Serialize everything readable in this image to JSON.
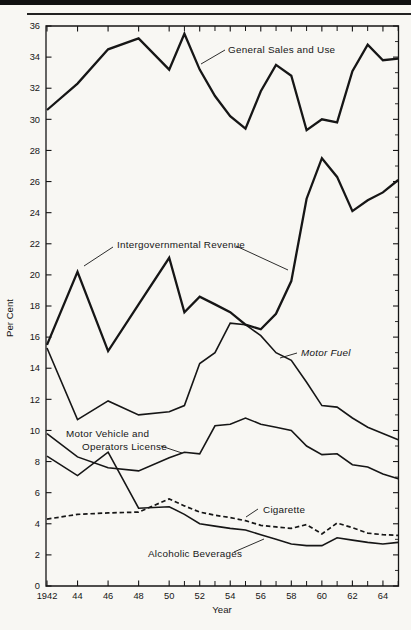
{
  "chart_data": {
    "type": "line",
    "title": "",
    "xlabel": "Year",
    "ylabel": "Per Cent",
    "xlim": [
      1942,
      1965
    ],
    "ylim": [
      0,
      36
    ],
    "grid": false,
    "legend": "inline-annotations",
    "line_color": "#161616",
    "x": [
      1942,
      1944,
      1946,
      1948,
      1950,
      1951,
      1952,
      1953,
      1954,
      1955,
      1956,
      1957,
      1958,
      1959,
      1960,
      1961,
      1962,
      1963,
      1964,
      1965
    ],
    "series": [
      {
        "name": "General Sales and Use",
        "key": "general-sales-and-use",
        "dash": false,
        "width": 2.3,
        "values": [
          30.6,
          32.3,
          34.5,
          35.2,
          33.2,
          35.5,
          33.2,
          31.5,
          30.2,
          29.4,
          31.8,
          33.5,
          32.8,
          29.3,
          30.0,
          29.8,
          33.1,
          34.8,
          33.8,
          33.9
        ]
      },
      {
        "name": "Intergovernmental Revenue",
        "key": "intergovernmental-revenue",
        "dash": false,
        "width": 2.3,
        "values": [
          15.5,
          20.2,
          15.1,
          18.1,
          21.1,
          17.6,
          18.6,
          18.1,
          17.6,
          16.8,
          16.5,
          17.5,
          19.6,
          24.9,
          27.5,
          26.3,
          24.1,
          24.8,
          25.3,
          26.1
        ]
      },
      {
        "name": "Motor Fuel",
        "key": "motor-fuel",
        "dash": false,
        "width": 1.6,
        "values": [
          15.3,
          10.7,
          11.9,
          11.0,
          11.2,
          11.6,
          14.3,
          15.0,
          16.9,
          16.8,
          16.1,
          15.0,
          14.5,
          13.1,
          11.6,
          11.5,
          10.8,
          10.2,
          9.8,
          9.4
        ]
      },
      {
        "name": "Motor Vehicle and Operators License",
        "key": "motor-vehicle-and-operators-license",
        "dash": false,
        "width": 1.6,
        "values": [
          9.8,
          8.3,
          7.6,
          7.4,
          8.25,
          8.6,
          8.5,
          10.3,
          10.4,
          10.8,
          10.4,
          10.2,
          10.0,
          9.0,
          8.45,
          8.5,
          7.8,
          7.65,
          7.2,
          6.9
        ]
      },
      {
        "name": "Cigarette",
        "key": "cigarette",
        "dash": true,
        "width": 1.7,
        "values": [
          4.3,
          4.6,
          4.7,
          4.75,
          5.6,
          5.15,
          4.75,
          4.55,
          4.4,
          4.2,
          3.9,
          3.8,
          3.7,
          3.95,
          3.35,
          4.05,
          3.75,
          3.4,
          3.3,
          3.25
        ]
      },
      {
        "name": "Alcoholic Beverages",
        "key": "alcoholic-beverages",
        "dash": false,
        "width": 1.6,
        "values": [
          8.35,
          7.1,
          8.6,
          5.0,
          5.1,
          4.6,
          4.0,
          3.85,
          3.7,
          3.6,
          3.3,
          3.0,
          2.7,
          2.6,
          2.6,
          3.1,
          2.95,
          2.8,
          2.7,
          2.8
        ]
      }
    ],
    "annotations": [
      {
        "text": "General Sales and Use",
        "x": 228,
        "y": 53,
        "italic": false,
        "leaders": [
          [
            225,
            50,
            201,
            64
          ]
        ]
      },
      {
        "text": "Intergovernmental Revenue",
        "x": 117,
        "y": 248,
        "italic": false,
        "leaders": [
          [
            113,
            247,
            84,
            266
          ],
          [
            236,
            246,
            288,
            270
          ]
        ]
      },
      {
        "text": "Motor Fuel",
        "x": 301,
        "y": 356,
        "italic": true,
        "leaders": [
          [
            297,
            353,
            280,
            358
          ]
        ]
      },
      {
        "text": "Motor Vehicle and",
        "x": 66,
        "y": 437,
        "italic": false,
        "leaders": []
      },
      {
        "text": "Operators License",
        "x": 82,
        "y": 450,
        "italic": false,
        "leaders": [
          [
            161,
            446,
            182,
            453
          ]
        ]
      },
      {
        "text": "Cigarette",
        "x": 263,
        "y": 513,
        "italic": false,
        "leaders": [
          [
            258,
            509,
            246,
            517
          ]
        ]
      },
      {
        "text": "Alcoholic Beverages",
        "x": 148,
        "y": 557,
        "italic": false,
        "leaders": [
          [
            234,
            552,
            264,
            539
          ]
        ]
      }
    ],
    "x_axis": {
      "tick_values": [
        1942,
        1944,
        1946,
        1948,
        1950,
        1952,
        1954,
        1956,
        1958,
        1960,
        1962,
        1964
      ],
      "tick_labels": [
        "1942",
        "44",
        "46",
        "48",
        "50",
        "52",
        "54",
        "56",
        "58",
        "60",
        "62",
        "64"
      ],
      "minor_tick_values": [
        1951,
        1953,
        1955,
        1957,
        1959,
        1961,
        1963,
        1965
      ]
    },
    "y_axis": {
      "tick_values": [
        0,
        2,
        4,
        6,
        8,
        10,
        12,
        14,
        16,
        18,
        20,
        22,
        24,
        26,
        28,
        30,
        32,
        34,
        36
      ],
      "tick_labels": [
        "0",
        "2",
        "4",
        "6",
        "8",
        "10",
        "12",
        "14",
        "16",
        "18",
        "20",
        "22",
        "24",
        "26",
        "28",
        "30",
        "32",
        "34",
        "36"
      ],
      "right_minor_step": 1
    }
  }
}
